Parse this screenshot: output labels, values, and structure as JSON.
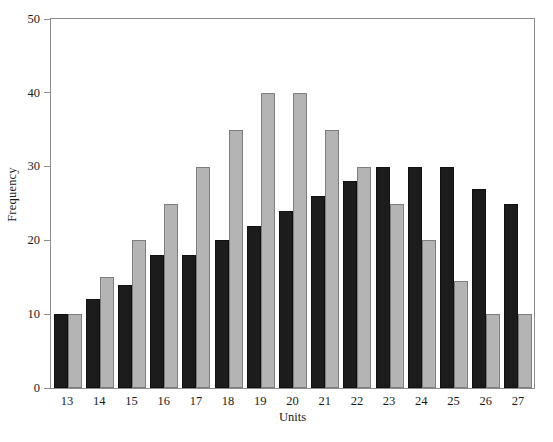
{
  "chart_data": {
    "type": "bar",
    "title": "",
    "xlabel": "Units",
    "ylabel": "Frequency",
    "categories": [
      "13",
      "14",
      "15",
      "16",
      "17",
      "18",
      "19",
      "20",
      "21",
      "22",
      "23",
      "24",
      "25",
      "26",
      "27"
    ],
    "series": [
      {
        "name": "dark",
        "color": "#1c1c1c",
        "values": [
          10,
          12,
          14,
          18,
          18,
          20,
          22,
          24,
          26,
          28,
          30,
          30,
          30,
          27,
          25
        ]
      },
      {
        "name": "light",
        "color": "#b4b4b4",
        "values": [
          10,
          15,
          20,
          25,
          30,
          35,
          40,
          40,
          35,
          30,
          25,
          20,
          14.5,
          10,
          10
        ]
      }
    ],
    "ylim": [
      0,
      50
    ],
    "yticks": [
      0,
      10,
      20,
      30,
      40,
      50
    ],
    "ytick_labels": [
      "0",
      "10",
      "20",
      "30",
      "40",
      "50"
    ],
    "grid": false,
    "legend": "none"
  },
  "axes": {
    "y_title": "Frequency",
    "x_title": "Units"
  }
}
